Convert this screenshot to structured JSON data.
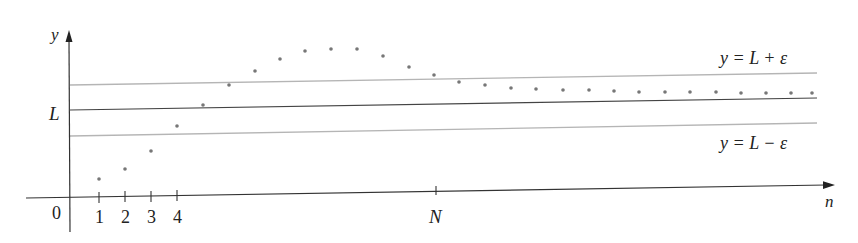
{
  "diagram": {
    "axes": {
      "x_label": "n",
      "y_label": "y",
      "origin_label": "0",
      "x_ticks": [
        "1",
        "2",
        "3",
        "4"
      ],
      "N_label": "N",
      "L_label": "L"
    },
    "bands": {
      "upper_label": "y = L + ε",
      "lower_label": "y = L − ε"
    },
    "colors": {
      "axis": "#333333",
      "limit_line": "#444444",
      "band_line": "#b5b5b5",
      "points": "#777777",
      "text": "#222222"
    },
    "points": [
      [
        99,
        179
      ],
      [
        125,
        169
      ],
      [
        151,
        151
      ],
      [
        177,
        126
      ],
      [
        203,
        105
      ],
      [
        229,
        85
      ],
      [
        255,
        71
      ],
      [
        280,
        59
      ],
      [
        305,
        51
      ],
      [
        331,
        49
      ],
      [
        357,
        49
      ],
      [
        383,
        56
      ],
      [
        409,
        67
      ],
      [
        434,
        75
      ],
      [
        459,
        82
      ],
      [
        485,
        85
      ],
      [
        511,
        88
      ],
      [
        536,
        89
      ],
      [
        563,
        90
      ],
      [
        589,
        90
      ],
      [
        614,
        91
      ],
      [
        639,
        92
      ],
      [
        665,
        92
      ],
      [
        690,
        92
      ],
      [
        716,
        92
      ],
      [
        741,
        93
      ],
      [
        766,
        93
      ],
      [
        791,
        93
      ],
      [
        812,
        93
      ]
    ]
  }
}
